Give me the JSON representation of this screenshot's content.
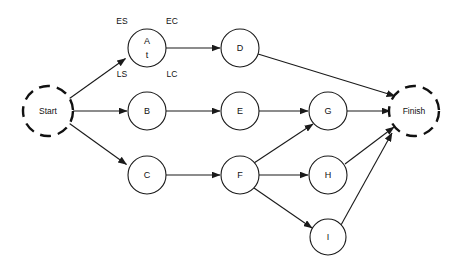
{
  "diagram": {
    "type": "activity-on-node-network",
    "background_color": "#ffffff",
    "stroke_color": "#1a1a1a",
    "terminals": [
      {
        "id": "start",
        "label": "Start",
        "cx": 48,
        "cy": 111,
        "r": 25
      },
      {
        "id": "finish",
        "label": "Finish",
        "cx": 414,
        "cy": 111,
        "r": 25
      }
    ],
    "nodes": [
      {
        "id": "A",
        "label": "A",
        "sublabel": "t",
        "cx": 147,
        "cy": 48,
        "r": 19
      },
      {
        "id": "B",
        "label": "B",
        "sublabel": "",
        "cx": 147,
        "cy": 111,
        "r": 19
      },
      {
        "id": "C",
        "label": "C",
        "sublabel": "",
        "cx": 147,
        "cy": 175,
        "r": 19
      },
      {
        "id": "D",
        "label": "D",
        "sublabel": "",
        "cx": 240,
        "cy": 48,
        "r": 19
      },
      {
        "id": "E",
        "label": "E",
        "sublabel": "",
        "cx": 240,
        "cy": 111,
        "r": 19
      },
      {
        "id": "F",
        "label": "F",
        "sublabel": "",
        "cx": 240,
        "cy": 175,
        "r": 19
      },
      {
        "id": "G",
        "label": "G",
        "sublabel": "",
        "cx": 328,
        "cy": 111,
        "r": 19
      },
      {
        "id": "H",
        "label": "H",
        "sublabel": "",
        "cx": 328,
        "cy": 175,
        "r": 19
      },
      {
        "id": "I",
        "label": "I",
        "sublabel": "",
        "cx": 328,
        "cy": 237,
        "r": 18
      }
    ],
    "corner_annotations": [
      {
        "id": "es",
        "label": "ES",
        "x": 122,
        "y": 22,
        "meaning": "early-start"
      },
      {
        "id": "ec",
        "label": "EC",
        "x": 172,
        "y": 22,
        "meaning": "early-completion"
      },
      {
        "id": "ls",
        "label": "LS",
        "x": 122,
        "y": 75,
        "meaning": "late-start"
      },
      {
        "id": "lc",
        "label": "LC",
        "x": 172,
        "y": 75,
        "meaning": "late-completion"
      }
    ],
    "edges": [
      {
        "id": "start-a",
        "from": "start",
        "to": "A"
      },
      {
        "id": "start-b",
        "from": "start",
        "to": "B"
      },
      {
        "id": "start-c",
        "from": "start",
        "to": "C"
      },
      {
        "id": "a-d",
        "from": "A",
        "to": "D"
      },
      {
        "id": "b-e",
        "from": "B",
        "to": "E"
      },
      {
        "id": "c-f",
        "from": "C",
        "to": "F"
      },
      {
        "id": "d-finish",
        "from": "D",
        "to": "finish"
      },
      {
        "id": "e-g",
        "from": "E",
        "to": "G"
      },
      {
        "id": "f-g",
        "from": "F",
        "to": "G"
      },
      {
        "id": "f-h",
        "from": "F",
        "to": "H"
      },
      {
        "id": "f-i",
        "from": "F",
        "to": "I"
      },
      {
        "id": "g-finish",
        "from": "G",
        "to": "finish"
      },
      {
        "id": "h-finish",
        "from": "H",
        "to": "finish"
      },
      {
        "id": "i-finish",
        "from": "I",
        "to": "finish"
      }
    ]
  }
}
